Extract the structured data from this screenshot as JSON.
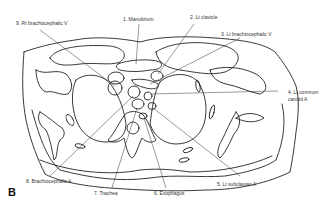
{
  "figure": {
    "panel_letter": "B",
    "line_color": "#222222",
    "background": "#ffffff"
  },
  "labels": [
    {
      "id": "rt-brachiocephalic-v",
      "text": "9. Rt brachiocephalic V"
    },
    {
      "id": "manubrium",
      "text": "1. Manubrium"
    },
    {
      "id": "lt-clavicle",
      "text": "2. Lt clavicle"
    },
    {
      "id": "lt-brachiocephalic-v",
      "text": "3. Lt brachiocephalic V"
    },
    {
      "id": "lt-common-carotid-a-line1",
      "text": "4. Lt common"
    },
    {
      "id": "lt-common-carotid-a-line2",
      "text": "carotid A"
    },
    {
      "id": "lt-subclavian-a",
      "text": "5. Lt subclavian A"
    },
    {
      "id": "esophagus",
      "text": "6. Esophagus"
    },
    {
      "id": "trachea",
      "text": "7. Trachea"
    },
    {
      "id": "brachiocephalic-a",
      "text": "8. Brachiocephalic A"
    }
  ]
}
